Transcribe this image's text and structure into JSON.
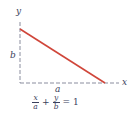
{
  "diagram": {
    "axes": {
      "x_label": "x",
      "y_label": "y",
      "style": "dashed",
      "color": "#8a8d9e"
    },
    "line": {
      "color": "#d0463a",
      "from": "y-intercept b",
      "to": "x-intercept a"
    },
    "intercept_labels": {
      "a": "a",
      "b": "b"
    },
    "equation": {
      "term1_num": "x",
      "term1_den": "a",
      "plus": "+",
      "term2_num": "y",
      "term2_den": "b",
      "equals": "=",
      "rhs": "1",
      "text": "x/a + y/b = 1"
    }
  }
}
